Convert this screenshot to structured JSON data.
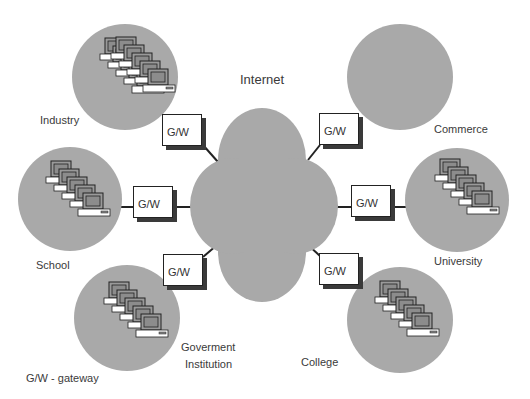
{
  "title": "Internet",
  "legend": "G/W -  gateway",
  "gateway_label": "G/W",
  "colors": {
    "cloud": "#a9a9a9",
    "site": "#a9a9a9",
    "line": "#222222",
    "shadow": "#3a3a3a"
  },
  "sites": [
    {
      "name": "Industry",
      "position": "top-left"
    },
    {
      "name": "Commerce",
      "position": "top-right"
    },
    {
      "name": "School",
      "position": "middle-left"
    },
    {
      "name": "University",
      "position": "middle-right"
    },
    {
      "name_line1": "Goverment",
      "name_line2": "Institution",
      "position": "bottom-left"
    },
    {
      "name": "College",
      "position": "bottom-right"
    }
  ],
  "gateways": [
    {
      "label": "G/W",
      "site": "Industry"
    },
    {
      "label": "G/W",
      "site": "Commerce"
    },
    {
      "label": "G/W",
      "site": "School"
    },
    {
      "label": "G/W",
      "site": "University"
    },
    {
      "label": "G/W",
      "site": "Goverment Institution"
    },
    {
      "label": "G/W",
      "site": "College"
    }
  ]
}
